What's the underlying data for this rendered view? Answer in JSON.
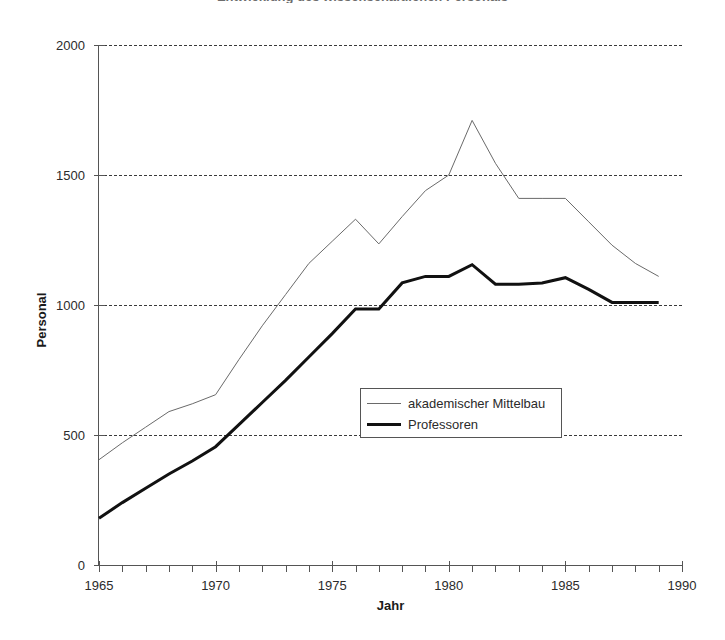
{
  "chart_data": {
    "type": "line",
    "title": "Entwicklung des wissenschaftlichen Personals",
    "xlabel": "Jahr",
    "ylabel": "Personal",
    "xlim": [
      1965,
      1990
    ],
    "ylim": [
      0,
      2000
    ],
    "grid": true,
    "grid_axis": "y",
    "legend_position": "center",
    "x_ticks": [
      1965,
      1970,
      1975,
      1980,
      1985,
      1990
    ],
    "x_minor_tick_step": 1,
    "y_ticks": [
      0,
      500,
      1000,
      1500,
      2000
    ],
    "x": [
      1965,
      1966,
      1967,
      1968,
      1969,
      1970,
      1971,
      1972,
      1973,
      1974,
      1975,
      1976,
      1977,
      1978,
      1979,
      1980,
      1981,
      1982,
      1983,
      1984,
      1985,
      1986,
      1987,
      1988,
      1989
    ],
    "series": [
      {
        "name": "akademischer Mittelbau",
        "style": "thin",
        "color": "#6a6a6a",
        "width": 1,
        "values": [
          405,
          470,
          530,
          590,
          620,
          655,
          790,
          920,
          1040,
          1160,
          1245,
          1330,
          1235,
          1340,
          1440,
          1500,
          1710,
          1545,
          1410,
          1410,
          1410,
          1320,
          1230,
          1160,
          1110
        ]
      },
      {
        "name": "Professoren",
        "style": "thick",
        "color": "#111111",
        "width": 3,
        "values": [
          180,
          240,
          295,
          350,
          400,
          455,
          540,
          625,
          710,
          800,
          890,
          985,
          985,
          1085,
          1110,
          1110,
          1155,
          1080,
          1080,
          1085,
          1105,
          1060,
          1010,
          1010,
          1010
        ]
      }
    ]
  },
  "axis": {
    "y_title": "Personal",
    "x_title": "Jahr",
    "y_tick_labels": [
      "0",
      "500",
      "1000",
      "1500",
      "2000"
    ],
    "x_tick_labels": [
      "1965",
      "1970",
      "1975",
      "1980",
      "1985",
      "1990"
    ]
  },
  "legend": {
    "items": [
      {
        "label": "akademischer Mittelbau",
        "style": "thin"
      },
      {
        "label": "Professoren",
        "style": "thick"
      }
    ]
  }
}
